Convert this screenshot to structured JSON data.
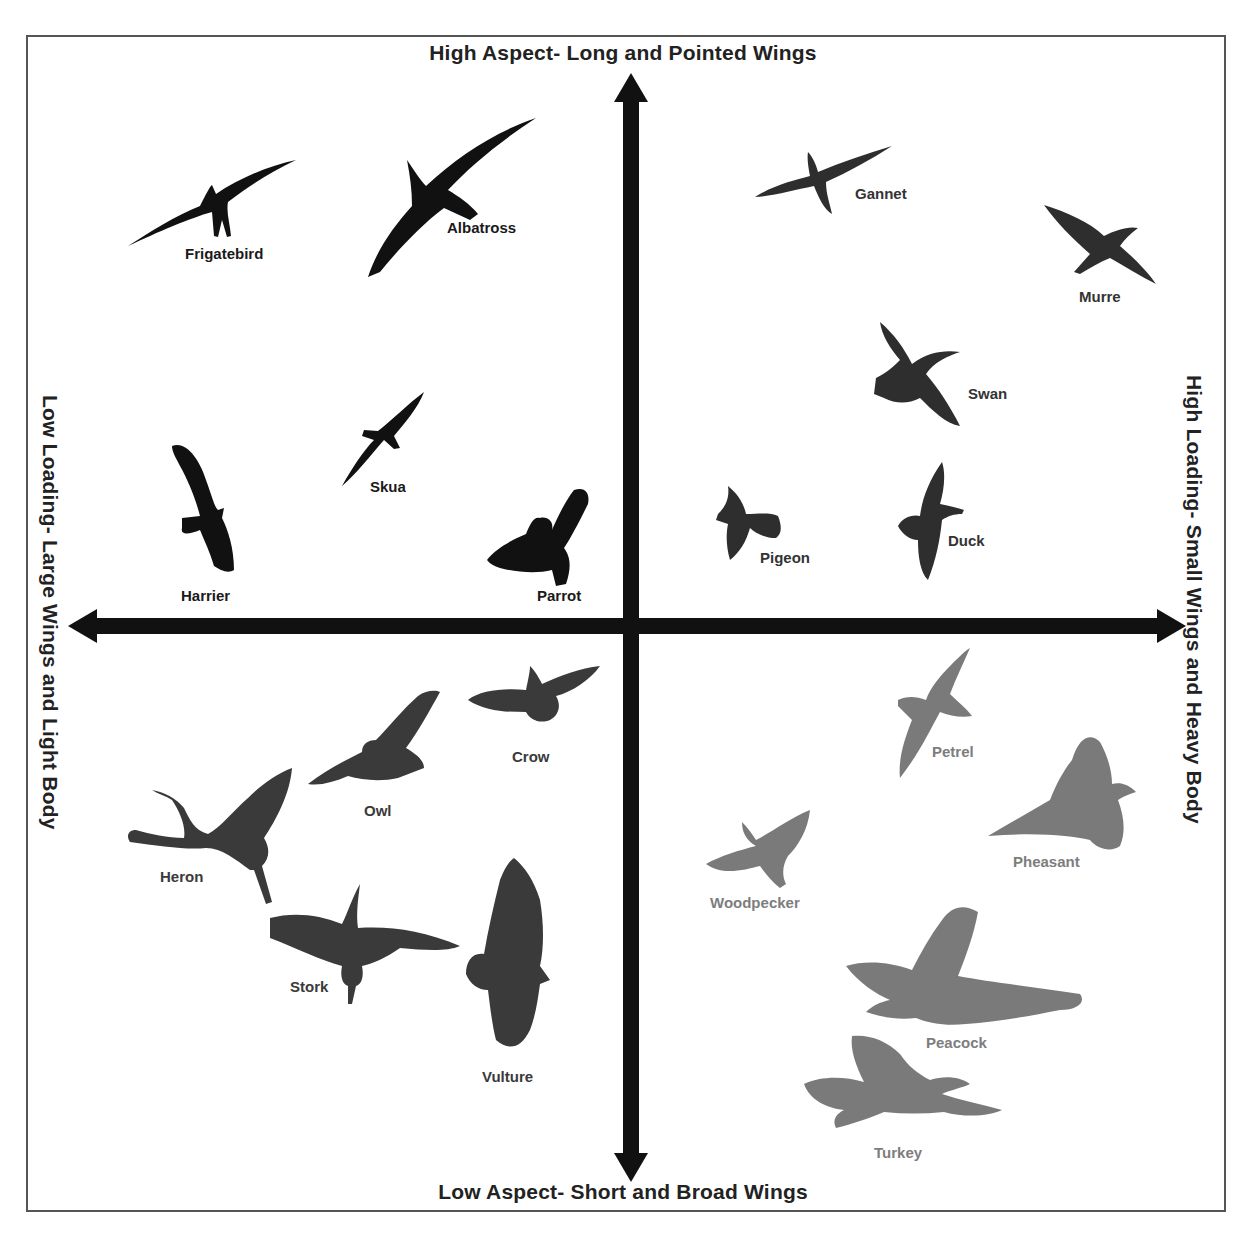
{
  "diagram": {
    "axes": {
      "top": "High Aspect- Long and Pointed Wings",
      "bottom": "Low Aspect- Short and Broad Wings",
      "left": "Low Loading- Large Wings and Light Body",
      "right": "High Loading- Small Wings and Heavy Body"
    },
    "colors": {
      "axis": "#111111",
      "frame": "#555555",
      "top_left": "#111111",
      "top_right": "#2e2e2e",
      "bottom_left": "#3a3a3a",
      "bottom_right": "#7a7a7a"
    },
    "quadrants": {
      "top_left": {
        "description": "High aspect, low loading",
        "birds": [
          {
            "name": "Frigatebird",
            "label_x": 185,
            "label_y": 245
          },
          {
            "name": "Albatross",
            "label_x": 447,
            "label_y": 219
          },
          {
            "name": "Skua",
            "label_x": 370,
            "label_y": 478
          },
          {
            "name": "Harrier",
            "label_x": 181,
            "label_y": 587
          },
          {
            "name": "Parrot",
            "label_x": 537,
            "label_y": 587
          }
        ]
      },
      "top_right": {
        "description": "High aspect, high loading",
        "birds": [
          {
            "name": "Gannet",
            "label_x": 855,
            "label_y": 185
          },
          {
            "name": "Murre",
            "label_x": 1079,
            "label_y": 288
          },
          {
            "name": "Swan",
            "label_x": 968,
            "label_y": 385
          },
          {
            "name": "Duck",
            "label_x": 948,
            "label_y": 532
          },
          {
            "name": "Pigeon",
            "label_x": 760,
            "label_y": 549
          }
        ]
      },
      "bottom_left": {
        "description": "Low aspect, low loading",
        "birds": [
          {
            "name": "Crow",
            "label_x": 512,
            "label_y": 748
          },
          {
            "name": "Owl",
            "label_x": 364,
            "label_y": 802
          },
          {
            "name": "Heron",
            "label_x": 160,
            "label_y": 868
          },
          {
            "name": "Stork",
            "label_x": 290,
            "label_y": 978
          },
          {
            "name": "Vulture",
            "label_x": 482,
            "label_y": 1068
          }
        ]
      },
      "bottom_right": {
        "description": "Low aspect, high loading",
        "birds": [
          {
            "name": "Petrel",
            "label_x": 932,
            "label_y": 743
          },
          {
            "name": "Pheasant",
            "label_x": 1013,
            "label_y": 853
          },
          {
            "name": "Woodpecker",
            "label_x": 710,
            "label_y": 894
          },
          {
            "name": "Peacock",
            "label_x": 926,
            "label_y": 1034
          },
          {
            "name": "Turkey",
            "label_x": 874,
            "label_y": 1144
          }
        ]
      }
    }
  }
}
